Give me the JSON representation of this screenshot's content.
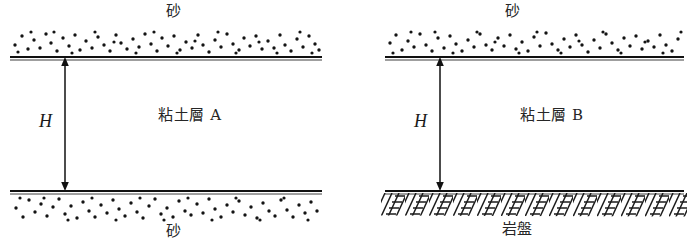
{
  "figure": {
    "width": 694,
    "height": 251,
    "background": "#ffffff",
    "ink": "#111111",
    "type": "geotechnical-cross-section-pair"
  },
  "panels": [
    {
      "id": "left",
      "top_label": "砂",
      "middle_label": "粘土層 A",
      "bottom_label": "砂",
      "dimension_label": "H",
      "top_material": "sand",
      "middle_material": "clay",
      "bottom_material": "sand",
      "bottom_boundary_style": "dotted-sand",
      "drainage": "double-drained"
    },
    {
      "id": "right",
      "top_label": "砂",
      "middle_label": "粘土層 B",
      "bottom_label": "岩盤",
      "dimension_label": "H",
      "top_material": "sand",
      "middle_material": "clay",
      "bottom_material": "bedrock",
      "bottom_boundary_style": "hatched-rock",
      "drainage": "single-drained"
    }
  ]
}
